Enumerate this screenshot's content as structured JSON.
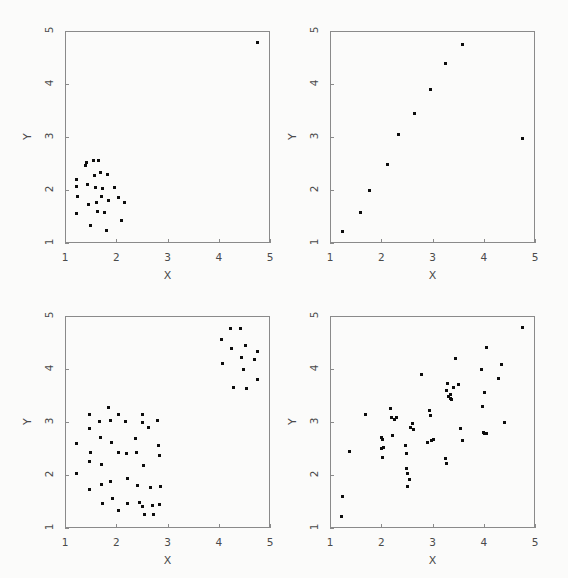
{
  "figure": {
    "background_color": "#fbfbfa",
    "marker_color": "#0d0d0d",
    "axis_color": "#8a8a8a",
    "label_color": "#4a4a4a"
  },
  "chart_data": [
    {
      "type": "scatter",
      "title": "",
      "xlabel": "X",
      "ylabel": "Y",
      "xlim": [
        1,
        5
      ],
      "ylim": [
        1,
        5
      ],
      "xticks": [
        1,
        2,
        3,
        4,
        5
      ],
      "yticks": [
        1,
        2,
        3,
        4,
        5
      ],
      "xticklabels": [
        "1",
        "2",
        "3",
        "4",
        "5"
      ],
      "yticklabels": [
        "1",
        "2",
        "3",
        "4",
        "5"
      ],
      "grid": false,
      "legend": "none",
      "description": "single tight cluster near lower-left plus one far outlier at upper-right",
      "points": [
        [
          1.22,
          2.2
        ],
        [
          1.22,
          2.06
        ],
        [
          1.24,
          1.87
        ],
        [
          1.23,
          1.55
        ],
        [
          1.4,
          2.46
        ],
        [
          1.42,
          2.52
        ],
        [
          1.44,
          2.1
        ],
        [
          1.46,
          1.72
        ],
        [
          1.5,
          1.33
        ],
        [
          1.55,
          2.55
        ],
        [
          1.58,
          2.28
        ],
        [
          1.6,
          2.05
        ],
        [
          1.62,
          1.76
        ],
        [
          1.64,
          1.6
        ],
        [
          1.66,
          2.55
        ],
        [
          1.7,
          2.33
        ],
        [
          1.72,
          1.88
        ],
        [
          1.74,
          2.02
        ],
        [
          1.78,
          1.57
        ],
        [
          1.8,
          1.24
        ],
        [
          1.82,
          2.3
        ],
        [
          1.84,
          1.8
        ],
        [
          1.96,
          2.05
        ],
        [
          2.04,
          1.85
        ],
        [
          2.1,
          1.43
        ],
        [
          2.16,
          1.77
        ],
        [
          4.75,
          4.78
        ]
      ]
    },
    {
      "type": "scatter",
      "title": "",
      "xlabel": "X",
      "ylabel": "Y",
      "xlim": [
        1,
        5
      ],
      "ylim": [
        1,
        5
      ],
      "xticks": [
        1,
        2,
        3,
        4,
        5
      ],
      "yticks": [
        1,
        2,
        3,
        4,
        5
      ],
      "xticklabels": [
        "1",
        "2",
        "3",
        "4",
        "5"
      ],
      "yticklabels": [
        "1",
        "2",
        "3",
        "4",
        "5"
      ],
      "grid": false,
      "legend": "none",
      "description": "strong linear relationship with one high-leverage outlier at far right",
      "points": [
        [
          1.25,
          1.22
        ],
        [
          1.6,
          1.58
        ],
        [
          1.78,
          2.0
        ],
        [
          2.12,
          2.48
        ],
        [
          2.34,
          3.04
        ],
        [
          2.65,
          3.45
        ],
        [
          2.97,
          3.9
        ],
        [
          3.26,
          4.38
        ],
        [
          3.58,
          4.75
        ],
        [
          4.75,
          2.97
        ]
      ]
    },
    {
      "type": "scatter",
      "title": "",
      "xlabel": "X",
      "ylabel": "Y",
      "xlim": [
        1,
        5
      ],
      "ylim": [
        1,
        5
      ],
      "xticks": [
        1,
        2,
        3,
        4,
        5
      ],
      "yticks": [
        1,
        2,
        3,
        4,
        5
      ],
      "xticklabels": [
        "1",
        "2",
        "3",
        "4",
        "5"
      ],
      "yticklabels": [
        "1",
        "2",
        "3",
        "4",
        "5"
      ],
      "grid": false,
      "legend": "none",
      "description": "two separated clusters: large lower-left cluster and smaller upper-right cluster",
      "points": [
        [
          1.22,
          2.6
        ],
        [
          1.22,
          2.03
        ],
        [
          1.47,
          3.14
        ],
        [
          1.47,
          2.87
        ],
        [
          1.5,
          2.42
        ],
        [
          1.48,
          2.25
        ],
        [
          1.48,
          1.73
        ],
        [
          1.68,
          3.01
        ],
        [
          1.7,
          2.7
        ],
        [
          1.72,
          2.2
        ],
        [
          1.72,
          1.82
        ],
        [
          1.74,
          1.46
        ],
        [
          1.85,
          3.28
        ],
        [
          1.88,
          3.02
        ],
        [
          1.9,
          2.62
        ],
        [
          1.88,
          1.88
        ],
        [
          1.92,
          1.55
        ],
        [
          2.05,
          3.14
        ],
        [
          2.05,
          2.42
        ],
        [
          2.05,
          1.33
        ],
        [
          2.18,
          3.01
        ],
        [
          2.2,
          2.4
        ],
        [
          2.22,
          1.93
        ],
        [
          2.22,
          1.47
        ],
        [
          2.38,
          2.68
        ],
        [
          2.4,
          2.42
        ],
        [
          2.42,
          1.8
        ],
        [
          2.45,
          1.48
        ],
        [
          2.52,
          3.14
        ],
        [
          2.52,
          3.0
        ],
        [
          2.53,
          2.17
        ],
        [
          2.52,
          1.4
        ],
        [
          2.55,
          1.25
        ],
        [
          2.62,
          2.9
        ],
        [
          2.66,
          1.77
        ],
        [
          2.7,
          1.43
        ],
        [
          2.72,
          1.25
        ],
        [
          2.8,
          3.03
        ],
        [
          2.82,
          2.55
        ],
        [
          2.84,
          2.37
        ],
        [
          2.86,
          1.78
        ],
        [
          2.84,
          1.44
        ],
        [
          4.05,
          4.55
        ],
        [
          4.08,
          4.1
        ],
        [
          4.22,
          4.77
        ],
        [
          4.25,
          4.38
        ],
        [
          4.28,
          3.65
        ],
        [
          4.42,
          4.76
        ],
        [
          4.45,
          4.22
        ],
        [
          4.48,
          4.0
        ],
        [
          4.52,
          4.45
        ],
        [
          4.55,
          3.63
        ],
        [
          4.7,
          4.18
        ],
        [
          4.75,
          4.33
        ],
        [
          4.75,
          3.8
        ]
      ]
    },
    {
      "type": "scatter",
      "title": "",
      "xlabel": "X",
      "ylabel": "Y",
      "xlim": [
        1,
        5
      ],
      "ylim": [
        1,
        5
      ],
      "xticks": [
        1,
        2,
        3,
        4,
        5
      ],
      "yticks": [
        1,
        2,
        3,
        4,
        5
      ],
      "xticklabels": [
        "1",
        "2",
        "3",
        "4",
        "5"
      ],
      "yticklabels": [
        "1",
        "2",
        "3",
        "4",
        "5"
      ],
      "grid": false,
      "legend": "none",
      "description": "broad positive correlation scatter across the full range",
      "points": [
        [
          1.22,
          1.22
        ],
        [
          1.25,
          1.6
        ],
        [
          1.38,
          2.45
        ],
        [
          1.7,
          3.15
        ],
        [
          2.0,
          2.7
        ],
        [
          2.0,
          2.5
        ],
        [
          2.02,
          2.33
        ],
        [
          2.02,
          2.67
        ],
        [
          2.05,
          2.52
        ],
        [
          2.18,
          3.25
        ],
        [
          2.2,
          3.08
        ],
        [
          2.22,
          2.75
        ],
        [
          2.25,
          3.05
        ],
        [
          2.3,
          3.08
        ],
        [
          2.48,
          2.55
        ],
        [
          2.5,
          2.4
        ],
        [
          2.5,
          2.12
        ],
        [
          2.52,
          2.02
        ],
        [
          2.52,
          1.78
        ],
        [
          2.55,
          1.92
        ],
        [
          2.58,
          2.9
        ],
        [
          2.6,
          2.98
        ],
        [
          2.62,
          2.85
        ],
        [
          2.78,
          3.9
        ],
        [
          2.95,
          3.22
        ],
        [
          2.96,
          3.13
        ],
        [
          2.98,
          2.65
        ],
        [
          2.9,
          2.62
        ],
        [
          3.02,
          2.67
        ],
        [
          3.25,
          2.32
        ],
        [
          3.27,
          2.22
        ],
        [
          3.28,
          3.6
        ],
        [
          3.3,
          3.72
        ],
        [
          3.32,
          3.48
        ],
        [
          3.35,
          3.45
        ],
        [
          3.35,
          3.52
        ],
        [
          3.38,
          3.43
        ],
        [
          3.4,
          3.65
        ],
        [
          3.45,
          4.2
        ],
        [
          3.5,
          3.7
        ],
        [
          3.55,
          2.88
        ],
        [
          3.58,
          2.65
        ],
        [
          3.95,
          4.0
        ],
        [
          3.98,
          3.3
        ],
        [
          4.0,
          2.8
        ],
        [
          4.02,
          3.55
        ],
        [
          4.05,
          4.4
        ],
        [
          4.05,
          2.78
        ],
        [
          4.28,
          3.82
        ],
        [
          4.35,
          4.08
        ],
        [
          4.4,
          3.0
        ],
        [
          4.02,
          2.78
        ],
        [
          4.75,
          4.78
        ]
      ]
    }
  ]
}
